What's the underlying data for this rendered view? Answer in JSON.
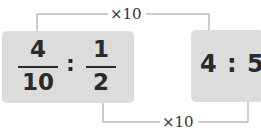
{
  "left_expression": {
    "fraction1": {
      "numerator": "4",
      "denominator": "10"
    },
    "separator": ":",
    "fraction2": {
      "numerator": "1",
      "denominator": "2"
    }
  },
  "right_expression": {
    "text": "4 : 5"
  },
  "connectors": {
    "top_label": "×10",
    "bottom_label": "×10"
  },
  "colors": {
    "box_fill": "#dcdcdc",
    "text": "#2a2a2a",
    "connector_line": "#9a9a9a"
  }
}
